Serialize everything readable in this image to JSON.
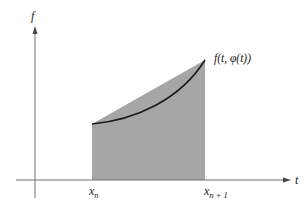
{
  "figure": {
    "y_axis_label": "f",
    "x_axis_label": "t",
    "curve_label": "f(t, φ(t))",
    "left_tick": {
      "base": "x",
      "sub": "n"
    },
    "right_tick": {
      "base": "x",
      "sub": "n + 1"
    }
  },
  "colors": {
    "shade": "#a6a6a6",
    "axis": "#707070",
    "curve": "#1a1a1a"
  }
}
